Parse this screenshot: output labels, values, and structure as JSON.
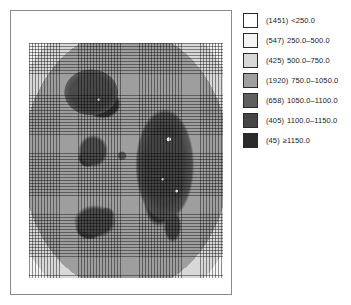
{
  "map": {
    "title": "",
    "panel_name": "classified-raster-map",
    "grid_overlay": true,
    "background_color": "#ffffff",
    "frame_color": "#8a8a8a"
  },
  "legend": {
    "name": "class-legend",
    "position": "right",
    "rows": [
      {
        "count": "(1451)",
        "range": "<250.0",
        "color": "#ffffff"
      },
      {
        "count": "(547)",
        "range": "250.0–500.0",
        "color": "#f4f4f4"
      },
      {
        "count": "(425)",
        "range": "500.0–750.0",
        "color": "#d8d8d8"
      },
      {
        "count": "(1920)",
        "range": "750.0–1050.0",
        "color": "#9e9e9e"
      },
      {
        "count": "(658)",
        "range": "1050.0–1100.0",
        "color": "#5f5f5f"
      },
      {
        "count": "(405)",
        "range": "1100.0–1150.0",
        "color": "#454545"
      },
      {
        "count": "(45)",
        "range": "≥1150.0",
        "color": "#2b2b2b"
      }
    ]
  },
  "chart_data": {
    "type": "heatmap",
    "title": "",
    "xlabel": "",
    "ylabel": "",
    "grid": true,
    "legend_position": "right",
    "classes": [
      {
        "label": "<250.0",
        "count": 1451,
        "min": null,
        "max": 250,
        "color": "#ffffff"
      },
      {
        "label": "250.0–500.0",
        "count": 547,
        "min": 250,
        "max": 500,
        "color": "#f4f4f4"
      },
      {
        "label": "500.0–750.0",
        "count": 425,
        "min": 500,
        "max": 750,
        "color": "#d8d8d8"
      },
      {
        "label": "750.0–1050.0",
        "count": 1920,
        "min": 750,
        "max": 1050,
        "color": "#9e9e9e"
      },
      {
        "label": "1050.0–1100.0",
        "count": 658,
        "min": 1050,
        "max": 1100,
        "color": "#5f5f5f"
      },
      {
        "label": "1100.0–1150.0",
        "count": 405,
        "min": 1100,
        "max": 1150,
        "color": "#454545"
      },
      {
        "label": "≥1150.0",
        "count": 45,
        "min": 1150,
        "max": null,
        "color": "#2b2b2b"
      }
    ],
    "total_cells": 5451
  }
}
